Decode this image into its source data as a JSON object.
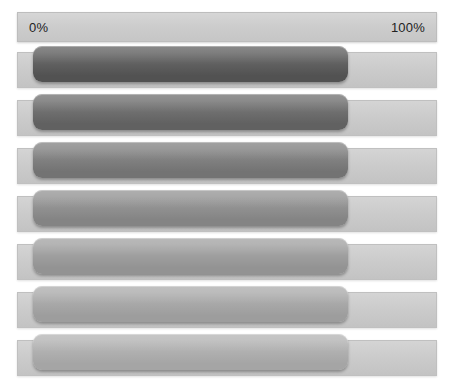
{
  "panel": {
    "title": "progress-bar-scale",
    "background_color": "#ffffff"
  },
  "scale": {
    "min_label": "0%",
    "max_label": "100%",
    "track_color": "#cdcdcd",
    "text_color": "#222222"
  },
  "chart_data": {
    "type": "bar",
    "title": "",
    "xlabel": "",
    "ylabel": "",
    "orientation": "horizontal",
    "grid": false,
    "legend": false,
    "xlim": [
      0,
      100
    ],
    "categories": [
      "row-1",
      "row-2",
      "row-3",
      "row-4",
      "row-5",
      "row-6",
      "row-7"
    ],
    "values": [
      75,
      75,
      75,
      75,
      75,
      75,
      75
    ],
    "tick_labels": [
      "0%",
      "100%"
    ]
  },
  "rows": [
    {
      "name": "progress-row-1",
      "value": 75,
      "fill_top": "#6e6e6e",
      "fill_bottom": "#525252"
    },
    {
      "name": "progress-row-2",
      "value": 75,
      "fill_top": "#7c7c7c",
      "fill_bottom": "#616161"
    },
    {
      "name": "progress-row-3",
      "value": 75,
      "fill_top": "#8d8d8d",
      "fill_bottom": "#737373"
    },
    {
      "name": "progress-row-4",
      "value": 75,
      "fill_top": "#9d9d9d",
      "fill_bottom": "#848484"
    },
    {
      "name": "progress-row-5",
      "value": 75,
      "fill_top": "#aaaaaa",
      "fill_bottom": "#939393"
    },
    {
      "name": "progress-row-6",
      "value": 75,
      "fill_top": "#b3b3b3",
      "fill_bottom": "#9d9d9d"
    },
    {
      "name": "progress-row-7",
      "value": 75,
      "fill_top": "#bababa",
      "fill_bottom": "#a5a5a5"
    }
  ]
}
